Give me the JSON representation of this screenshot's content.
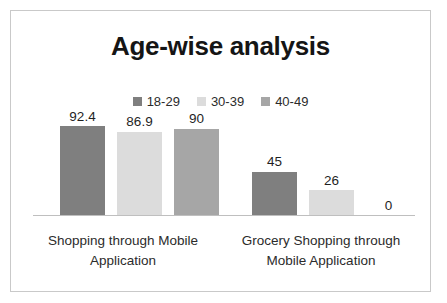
{
  "chart_data": {
    "type": "bar",
    "title": "Age-wise analysis",
    "xlabel": "",
    "ylabel": "",
    "ylim": [
      0,
      100
    ],
    "grid": false,
    "legend_position": "top-center",
    "categories": [
      "Shopping through Mobile Application",
      "Grocery Shopping through Mobile Application"
    ],
    "series": [
      {
        "name": "18-29",
        "color": "#7f7f7f",
        "values": [
          92.4,
          45
        ]
      },
      {
        "name": "30-39",
        "color": "#dcdcdc",
        "values": [
          86.9,
          26
        ]
      },
      {
        "name": "40-49",
        "color": "#a6a6a6",
        "values": [
          90,
          0
        ]
      }
    ],
    "value_labels": {
      "group_0": [
        "92.4",
        "86.9",
        "90"
      ],
      "group_1": [
        "45",
        "26",
        "0"
      ]
    }
  },
  "frame": {
    "border_color": "#c9c9c9",
    "axis_color": "#bfbfbf",
    "background": "#ffffff"
  }
}
